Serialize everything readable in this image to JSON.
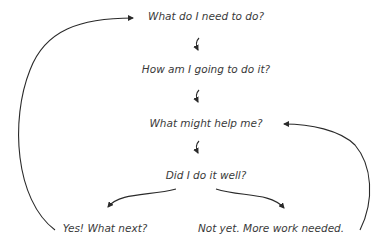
{
  "diagram": {
    "nodes": [
      {
        "id": "need",
        "label": "What do I need to do?"
      },
      {
        "id": "how",
        "label": "How am I going to do it?"
      },
      {
        "id": "help",
        "label": "What might help me?"
      },
      {
        "id": "well",
        "label": "Did I do it well?"
      },
      {
        "id": "yes",
        "label": "Yes! What next?"
      },
      {
        "id": "notyet",
        "label": "Not yet. More work needed."
      }
    ],
    "edges": [
      {
        "from": "need",
        "to": "how"
      },
      {
        "from": "how",
        "to": "help"
      },
      {
        "from": "help",
        "to": "well"
      },
      {
        "from": "well",
        "to": "yes"
      },
      {
        "from": "well",
        "to": "notyet"
      },
      {
        "from": "yes",
        "to": "need"
      },
      {
        "from": "notyet",
        "to": "help"
      }
    ],
    "stroke_color": "#2a2a2a",
    "text_color": "#3a3a3a"
  }
}
